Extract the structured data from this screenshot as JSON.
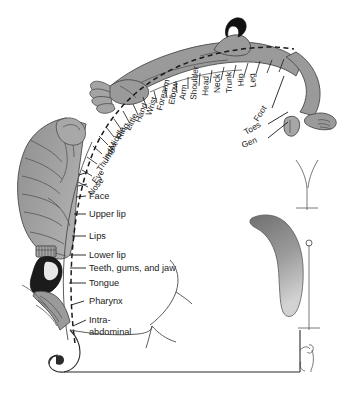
{
  "figure": {
    "type": "anatomical-diagram",
    "colors": {
      "background": "#ffffff",
      "body_gray": "#9a9a9a",
      "body_gray_light": "#b4b4b4",
      "body_gray_dark": "#7d7d7d",
      "hair_black": "#111111",
      "tongue_black": "#1b1b1b",
      "outline": "#4a4a4a",
      "text": "#1a1a1a"
    }
  },
  "arc_labels": [
    {
      "id": "nose",
      "label": "Nose"
    },
    {
      "id": "eye",
      "label": "Eye"
    },
    {
      "id": "thumb",
      "label": "Thumb"
    },
    {
      "id": "index",
      "label": "Index"
    },
    {
      "id": "middle",
      "label": "Middle"
    },
    {
      "id": "ring",
      "label": "Ring"
    },
    {
      "id": "little",
      "label": "Little"
    },
    {
      "id": "hand",
      "label": "Hand"
    },
    {
      "id": "wrist",
      "label": "Wrist"
    },
    {
      "id": "forearm",
      "label": "Forearm"
    },
    {
      "id": "elbow",
      "label": "Elbow"
    },
    {
      "id": "arm",
      "label": "Arm"
    },
    {
      "id": "shoulder",
      "label": "Shoulder"
    },
    {
      "id": "head",
      "label": "Head"
    },
    {
      "id": "neck",
      "label": "Neck"
    },
    {
      "id": "trunk",
      "label": "Trunk"
    },
    {
      "id": "hip",
      "label": "Hip"
    },
    {
      "id": "leg",
      "label": "Leg"
    }
  ],
  "fanned_labels": [
    {
      "id": "foot",
      "label": "Foot"
    },
    {
      "id": "toes",
      "label": "Toes"
    },
    {
      "id": "gen",
      "label": "Gen"
    }
  ],
  "side_labels": [
    {
      "id": "face",
      "label": "Face"
    },
    {
      "id": "upper-lip",
      "label": "Upper lip"
    },
    {
      "id": "lips",
      "label": "Lips"
    },
    {
      "id": "lower-lip",
      "label": "Lower lip"
    },
    {
      "id": "teeth",
      "label": "Teeth, gums, and jaw"
    },
    {
      "id": "tongue",
      "label": "Tongue"
    },
    {
      "id": "pharynx",
      "label": "Pharynx"
    },
    {
      "id": "intra-1",
      "label": "Intra-"
    },
    {
      "id": "intra-2",
      "label": "abdominal"
    }
  ]
}
